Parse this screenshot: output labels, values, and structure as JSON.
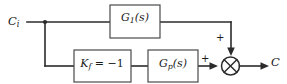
{
  "diagram": {
    "type": "control-block-diagram",
    "colors": {
      "background": "#ffffff",
      "wire": "#2b2b2b",
      "block_border": "#4a4a4a",
      "block_fill": "#ffffff",
      "text": "#1a1a1a"
    },
    "terminals": {
      "input": {
        "label_base": "C",
        "label_sub": "i",
        "full": "C_i"
      },
      "output": {
        "label_base": "C",
        "label_sub": "",
        "full": "C"
      }
    },
    "blocks": [
      {
        "id": "g1",
        "name": "forward-gain-block",
        "label_base": "G",
        "label_sub": "1",
        "label_suffix": "(s)",
        "full": "G_1(s)",
        "path": "upper"
      },
      {
        "id": "kf",
        "name": "feedforward-gain-block",
        "label_base": "K",
        "label_sub": "f",
        "label_suffix": " = −1",
        "full": "K_f = −1",
        "path": "lower"
      },
      {
        "id": "gp",
        "name": "plant-block",
        "label_base": "G",
        "label_sub": "p",
        "label_suffix": "(s)",
        "full": "G_p(s)",
        "path": "lower"
      }
    ],
    "summing_junction": {
      "name": "summing-junction",
      "glyph": "crossed-circle",
      "inputs": [
        {
          "from": "g1",
          "direction": "from-top",
          "sign": "+"
        },
        {
          "from": "gp",
          "direction": "from-left",
          "sign": "+"
        }
      ],
      "output": "C"
    },
    "branch_point": {
      "name": "signal-branch-point",
      "splits_to": [
        "g1",
        "kf"
      ]
    },
    "signs": {
      "top_input": "+",
      "left_input": "+"
    }
  }
}
